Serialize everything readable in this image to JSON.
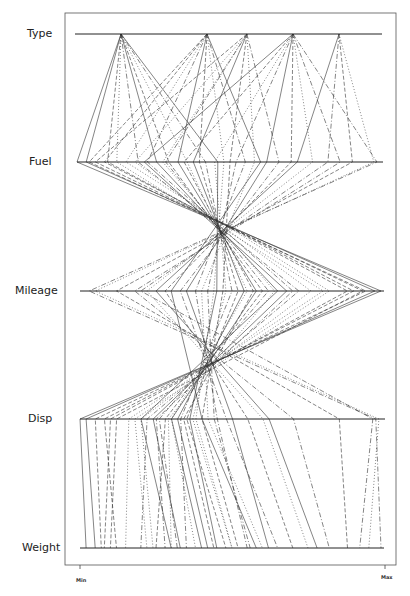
{
  "chart_data": {
    "type": "parallel_coordinates",
    "title": "",
    "axes": [
      "Type",
      "Fuel",
      "Mileage",
      "Disp",
      "Weight"
    ],
    "axis_y": [
      34,
      162,
      291,
      419,
      548
    ],
    "axis_x_range": [
      [
        75,
        382
      ],
      [
        77,
        383
      ],
      [
        80,
        384
      ],
      [
        80,
        385
      ],
      [
        80,
        384
      ]
    ],
    "x_scale_labels": {
      "min": "Min",
      "max": "Max"
    },
    "frame": {
      "x0": 65,
      "y0": 13,
      "x1": 396,
      "y1": 565
    },
    "observations": [
      [
        0.15,
        0.03,
        0.97,
        0.02,
        0.05
      ],
      [
        0.15,
        0.1,
        0.88,
        0.1,
        0.08
      ],
      [
        0.15,
        0.13,
        0.8,
        0.16,
        0.15
      ],
      [
        0.15,
        0.2,
        0.72,
        0.22,
        0.2
      ],
      [
        0.15,
        0.26,
        0.65,
        0.2,
        0.3
      ],
      [
        0.15,
        0.3,
        0.6,
        0.28,
        0.25
      ],
      [
        0.15,
        0.36,
        0.55,
        0.3,
        0.38
      ],
      [
        0.15,
        0.42,
        0.5,
        0.33,
        0.35
      ],
      [
        0.15,
        0.46,
        0.45,
        0.36,
        0.45
      ],
      [
        0.43,
        0.09,
        0.9,
        0.08,
        0.12
      ],
      [
        0.43,
        0.16,
        0.82,
        0.18,
        0.22
      ],
      [
        0.43,
        0.23,
        0.7,
        0.25,
        0.28
      ],
      [
        0.43,
        0.33,
        0.58,
        0.3,
        0.4
      ],
      [
        0.43,
        0.4,
        0.52,
        0.35,
        0.48
      ],
      [
        0.43,
        0.48,
        0.44,
        0.38,
        0.5
      ],
      [
        0.43,
        0.55,
        0.38,
        0.45,
        0.55
      ],
      [
        0.43,
        0.6,
        0.3,
        0.4,
        0.58
      ],
      [
        0.56,
        0.06,
        0.93,
        0.12,
        0.1
      ],
      [
        0.56,
        0.19,
        0.76,
        0.2,
        0.24
      ],
      [
        0.56,
        0.29,
        0.62,
        0.26,
        0.32
      ],
      [
        0.56,
        0.38,
        0.54,
        0.32,
        0.42
      ],
      [
        0.56,
        0.5,
        0.47,
        0.4,
        0.52
      ],
      [
        0.56,
        0.58,
        0.4,
        0.42,
        0.6
      ],
      [
        0.56,
        0.66,
        0.33,
        0.48,
        0.65
      ],
      [
        0.71,
        0.22,
        0.68,
        0.24,
        0.33
      ],
      [
        0.71,
        0.35,
        0.57,
        0.34,
        0.44
      ],
      [
        0.71,
        0.45,
        0.48,
        0.37,
        0.5
      ],
      [
        0.71,
        0.52,
        0.42,
        0.44,
        0.56
      ],
      [
        0.71,
        0.62,
        0.35,
        0.5,
        0.62
      ],
      [
        0.71,
        0.7,
        0.28,
        0.55,
        0.7
      ],
      [
        0.71,
        0.77,
        0.22,
        0.6,
        0.75
      ],
      [
        0.71,
        0.86,
        0.18,
        0.7,
        0.82
      ],
      [
        0.86,
        0.72,
        0.25,
        0.62,
        0.78
      ],
      [
        0.86,
        0.9,
        0.12,
        0.85,
        0.88
      ],
      [
        0.86,
        0.97,
        0.05,
        0.98,
        0.95
      ],
      [
        0.86,
        0.82,
        0.2,
        0.96,
        0.92
      ],
      [
        0.15,
        0.0,
        0.99,
        0.0,
        0.02
      ],
      [
        0.43,
        0.04,
        0.94,
        0.05,
        0.07
      ],
      [
        0.56,
        0.28,
        0.64,
        0.29,
        0.3
      ],
      [
        0.71,
        0.98,
        0.03,
        0.97,
        0.99
      ]
    ],
    "line_styles": [
      "solid",
      "dashed",
      "dotted",
      "dashdot"
    ]
  },
  "labels": {
    "type": "Type",
    "fuel": "Fuel",
    "mileage": "Mileage",
    "disp": "Disp",
    "weight": "Weight",
    "min": "Min",
    "max": "Max"
  }
}
